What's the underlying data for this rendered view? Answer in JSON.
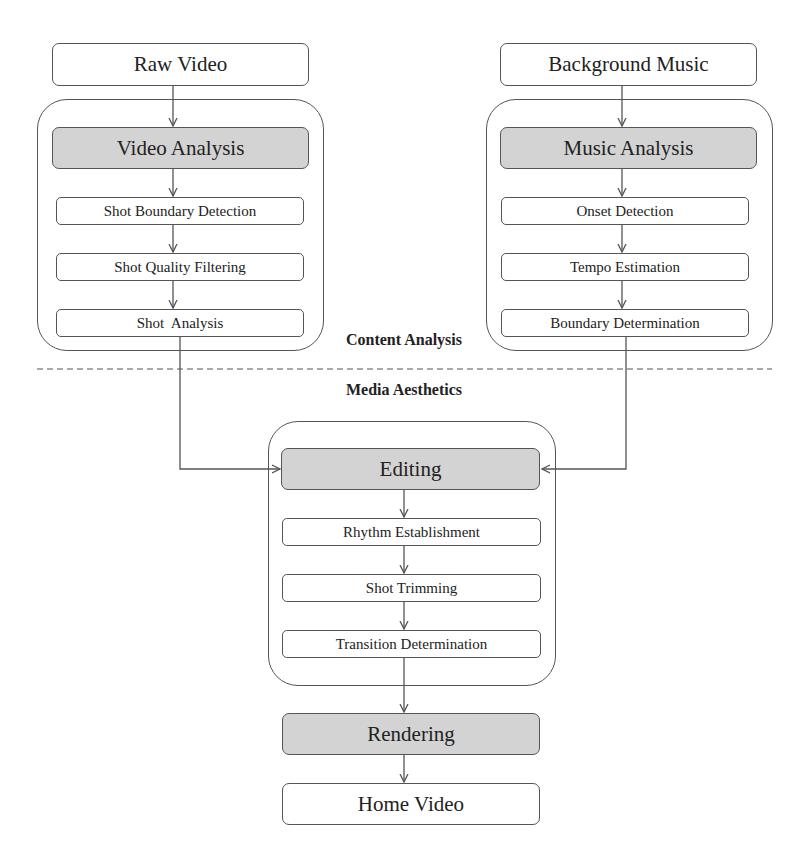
{
  "diagram": {
    "inputs": {
      "raw_video": "Raw Video",
      "background_music": "Background Music"
    },
    "video_branch": {
      "header": "Video Analysis",
      "steps": [
        "Shot Boundary Detection",
        "Shot Quality Filtering",
        "Shot  Analysis"
      ]
    },
    "music_branch": {
      "header": "Music Analysis",
      "steps": [
        "Onset Detection",
        "Tempo Estimation",
        "Boundary Determination"
      ]
    },
    "section_labels": {
      "upper": "Content Analysis",
      "lower": "Media Aesthetics"
    },
    "editing": {
      "header": "Editing",
      "steps": [
        "Rhythm Establishment",
        "Shot Trimming",
        "Transition Determination"
      ]
    },
    "rendering": "Rendering",
    "output": "Home Video",
    "colors": {
      "stroke": "#555555",
      "shaded_fill": "#d3d3d3",
      "background": "#ffffff"
    }
  }
}
